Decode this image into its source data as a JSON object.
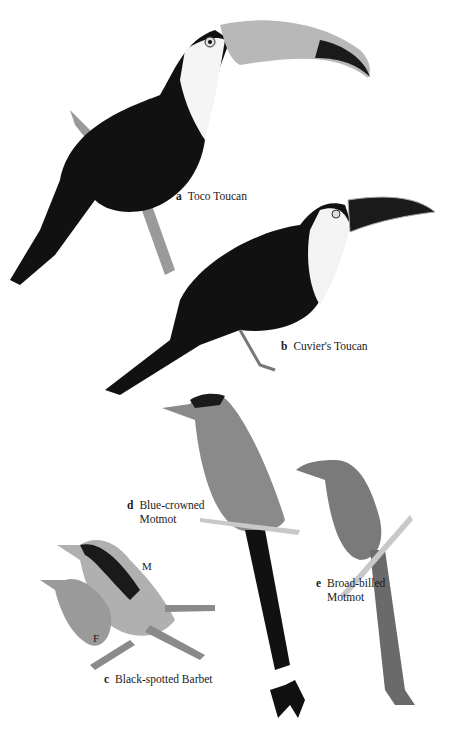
{
  "plate": {
    "background": "#ffffff",
    "birds": [
      {
        "id": "a",
        "name": "Toco Toucan",
        "lines": [
          "Toco Toucan"
        ]
      },
      {
        "id": "b",
        "name": "Cuvier's Toucan",
        "lines": [
          "Cuvier's Toucan"
        ]
      },
      {
        "id": "c",
        "name": "Black-spotted Barbet",
        "lines": [
          "Black-spotted Barbet"
        ],
        "sex_labels": [
          "M",
          "F"
        ]
      },
      {
        "id": "d",
        "name": "Blue-crowned Motmot",
        "lines": [
          "Blue-crowned",
          "Motmot"
        ]
      },
      {
        "id": "e",
        "name": "Broad-billed Motmot",
        "lines": [
          "Broad-billed",
          "Motmot"
        ]
      }
    ]
  }
}
